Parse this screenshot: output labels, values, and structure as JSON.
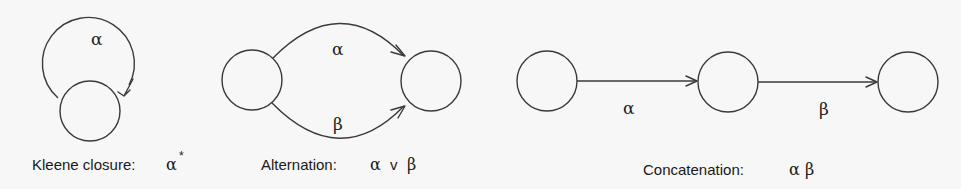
{
  "diagram": {
    "panels": [
      {
        "id": "kleene",
        "caption": "Kleene closure:",
        "expression": "α",
        "expression_superscript": "*",
        "edge_labels": [
          "α"
        ],
        "states": 1,
        "edges": [
          {
            "from": 0,
            "to": 0,
            "label": "α",
            "type": "self-loop"
          }
        ]
      },
      {
        "id": "alternation",
        "caption": "Alternation:",
        "expression": "α ∨ β",
        "expression_parts": [
          "α",
          "v",
          "β"
        ],
        "edge_labels": [
          "α",
          "β"
        ],
        "states": 2,
        "edges": [
          {
            "from": 0,
            "to": 1,
            "label": "α",
            "type": "arc-upper"
          },
          {
            "from": 0,
            "to": 1,
            "label": "β",
            "type": "arc-lower"
          }
        ]
      },
      {
        "id": "concatenation",
        "caption": "Concatenation:",
        "expression": "α β",
        "edge_labels": [
          "α",
          "β"
        ],
        "states": 3,
        "edges": [
          {
            "from": 0,
            "to": 1,
            "label": "α",
            "type": "straight"
          },
          {
            "from": 1,
            "to": 2,
            "label": "β",
            "type": "straight"
          }
        ]
      }
    ]
  },
  "labels": {
    "kleene_caption": "Kleene closure:",
    "kleene_expr": "α",
    "kleene_sup": "*",
    "kleene_edge": "α",
    "alt_caption": "Alternation:",
    "alt_expr_a": "α",
    "alt_expr_or": "v",
    "alt_expr_b": "β",
    "alt_edge_upper": "α",
    "alt_edge_lower": "β",
    "concat_caption": "Concatenation:",
    "concat_expr": "α β",
    "concat_edge_1": "α",
    "concat_edge_2": "β"
  },
  "colors": {
    "background": "#f7f7f7",
    "stroke": "#3a3a3a",
    "text": "#1a1a1a"
  }
}
